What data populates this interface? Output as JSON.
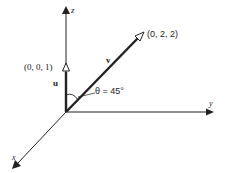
{
  "diagram": {
    "axes": {
      "z_label": "z",
      "y_label": "y",
      "x_label": "x"
    },
    "vectors": {
      "u": {
        "label": "u",
        "endpoint_label": "(0, 0, 1)"
      },
      "v": {
        "label": "v",
        "endpoint_label": "(0, 2, 2)"
      }
    },
    "angle": {
      "label": "θ = 45°"
    },
    "colors": {
      "stroke": "#222222",
      "background": "#ffffff"
    }
  }
}
